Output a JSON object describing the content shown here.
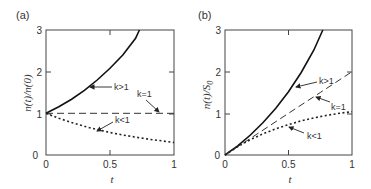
{
  "chart_data": [
    {
      "type": "line",
      "panel_label": "(a)",
      "title": "",
      "xlabel": "t",
      "ylabel": "n(t)/n(0)",
      "xlim": [
        0,
        1
      ],
      "ylim": [
        0,
        3
      ],
      "xticks": [
        "0",
        "0.5",
        "1"
      ],
      "yticks": [
        "0",
        "1",
        "2",
        "3"
      ],
      "grid": false,
      "legend": "none (inline arrow annotations)",
      "series": [
        {
          "name": "k>1",
          "style": "solid",
          "x": [
            0,
            0.1,
            0.2,
            0.3,
            0.4,
            0.5,
            0.6,
            0.7,
            0.73
          ],
          "y": [
            1.0,
            1.16,
            1.34,
            1.55,
            1.8,
            2.08,
            2.4,
            2.8,
            3.0
          ]
        },
        {
          "name": "k=1",
          "style": "dashed",
          "x": [
            0,
            0.25,
            0.5,
            0.75,
            1.0
          ],
          "y": [
            1.0,
            1.0,
            1.0,
            1.0,
            1.0
          ]
        },
        {
          "name": "k<1",
          "style": "dotted",
          "x": [
            0,
            0.1,
            0.2,
            0.3,
            0.4,
            0.5,
            0.6,
            0.7,
            0.8,
            0.9,
            1.0
          ],
          "y": [
            1.0,
            0.88,
            0.78,
            0.69,
            0.61,
            0.54,
            0.48,
            0.43,
            0.38,
            0.34,
            0.3
          ]
        }
      ],
      "annotations": [
        {
          "text": "k>1",
          "target_x": 0.33,
          "target_y": 1.62
        },
        {
          "text": "k=1",
          "target_x": 0.88,
          "target_y": 1.0
        },
        {
          "text": "k<1",
          "target_x": 0.37,
          "target_y": 0.62
        }
      ]
    },
    {
      "type": "line",
      "panel_label": "(b)",
      "title": "",
      "xlabel": "t",
      "ylabel": "n(t)/S0",
      "xlim": [
        0,
        1
      ],
      "ylim": [
        0,
        3
      ],
      "xticks": [
        "0",
        "0.5",
        "1"
      ],
      "yticks": [
        "0",
        "1",
        "2",
        "3"
      ],
      "grid": false,
      "legend": "none (inline arrow annotations)",
      "series": [
        {
          "name": "k>1",
          "style": "solid",
          "x": [
            0,
            0.1,
            0.2,
            0.3,
            0.4,
            0.5,
            0.6,
            0.7,
            0.77
          ],
          "y": [
            0,
            0.22,
            0.48,
            0.78,
            1.12,
            1.52,
            1.98,
            2.52,
            3.0
          ]
        },
        {
          "name": "k=1",
          "style": "dashed",
          "x": [
            0,
            0.25,
            0.5,
            0.75,
            1.0
          ],
          "y": [
            0,
            0.5,
            1.0,
            1.5,
            2.0
          ]
        },
        {
          "name": "k<1",
          "style": "dotted",
          "x": [
            0,
            0.1,
            0.2,
            0.3,
            0.4,
            0.5,
            0.6,
            0.7,
            0.8,
            0.9,
            1.0
          ],
          "y": [
            0,
            0.2,
            0.37,
            0.51,
            0.63,
            0.73,
            0.82,
            0.89,
            0.95,
            1.0,
            1.04
          ]
        }
      ],
      "annotations": [
        {
          "text": "k>1",
          "target_x": 0.55,
          "target_y": 1.65
        },
        {
          "text": "k=1",
          "target_x": 0.72,
          "target_y": 1.4
        },
        {
          "text": "k<1",
          "target_x": 0.5,
          "target_y": 0.7
        }
      ]
    }
  ],
  "panels": [
    {
      "label": "(a)",
      "ylabel_main": "n(t)/n(0)",
      "xlabel": "t",
      "xticks": [
        "0",
        "0.5",
        "1"
      ],
      "yticks": [
        "0",
        "1",
        "2",
        "3"
      ],
      "annot": [
        "k>1",
        "k=1",
        "k<1"
      ]
    },
    {
      "label": "(b)",
      "ylabel_main": "n(t)/S",
      "ylabel_sub": "0",
      "xlabel": "t",
      "xticks": [
        "0",
        "0.5",
        "1"
      ],
      "yticks": [
        "0",
        "1",
        "2",
        "3"
      ],
      "annot": [
        "k>1",
        "k=1",
        "k<1"
      ]
    }
  ]
}
